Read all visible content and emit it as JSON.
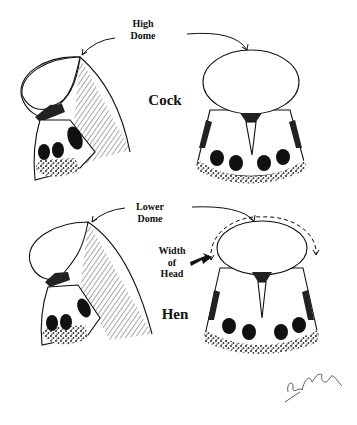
{
  "figure": {
    "top_row": {
      "annotation_line1": "High",
      "annotation_line2": "Dome",
      "sex_label": "Cock"
    },
    "bottom_row": {
      "annotation_line1": "Lower",
      "annotation_line2": "Dome",
      "width_line1": "Width",
      "width_line2": "of",
      "width_line3": "Head",
      "sex_label": "Hen"
    },
    "signature": "E. Peake",
    "colors": {
      "ink": "#111111",
      "paper": "#ffffff"
    }
  }
}
